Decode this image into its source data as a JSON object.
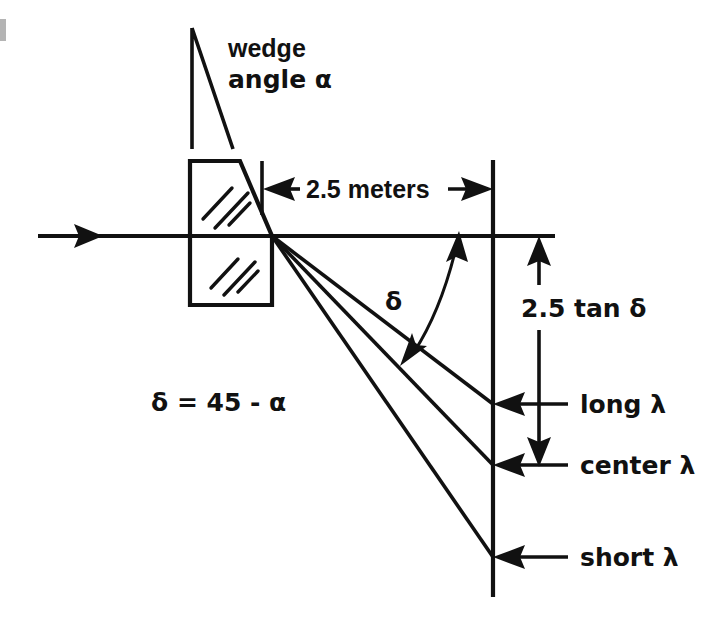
{
  "figure": {
    "background_color": "#ffffff",
    "ink_color": "#111111"
  },
  "labels": {
    "wedge_line1": "wedge",
    "wedge_line2": "angle α",
    "distance": "2.5 meters",
    "delta_symbol": "δ",
    "vertical_offset": "2.5 tan δ",
    "equation": "δ = 45 - α",
    "ray_long": "long λ",
    "ray_center": "center λ",
    "ray_short": "short λ"
  },
  "annotations": {
    "incoming_beam": "incoming-beam-arrow",
    "optical_axis": "optical-axis",
    "screen": "screen-line",
    "prism": "wedge-prism-body",
    "wedge_triangle": "wedge-angle-triangle",
    "delta_arc": "delta-angle-arc",
    "dimension_horizontal": "horizontal-dimension-2.5-meters",
    "dimension_vertical": "vertical-dimension-2.5-tan-delta"
  },
  "geometry": {
    "prism_apex": {
      "x": 272,
      "y": 236
    },
    "screen_x": 493,
    "axis_y": 236,
    "ray_endpoints": {
      "long": {
        "x": 493,
        "y": 404
      },
      "center": {
        "x": 493,
        "y": 465
      },
      "short": {
        "x": 493,
        "y": 557
      }
    },
    "dimension_line_x": 539,
    "distance_meters": 2.5,
    "delta_degrees_expression": "45 - alpha"
  }
}
